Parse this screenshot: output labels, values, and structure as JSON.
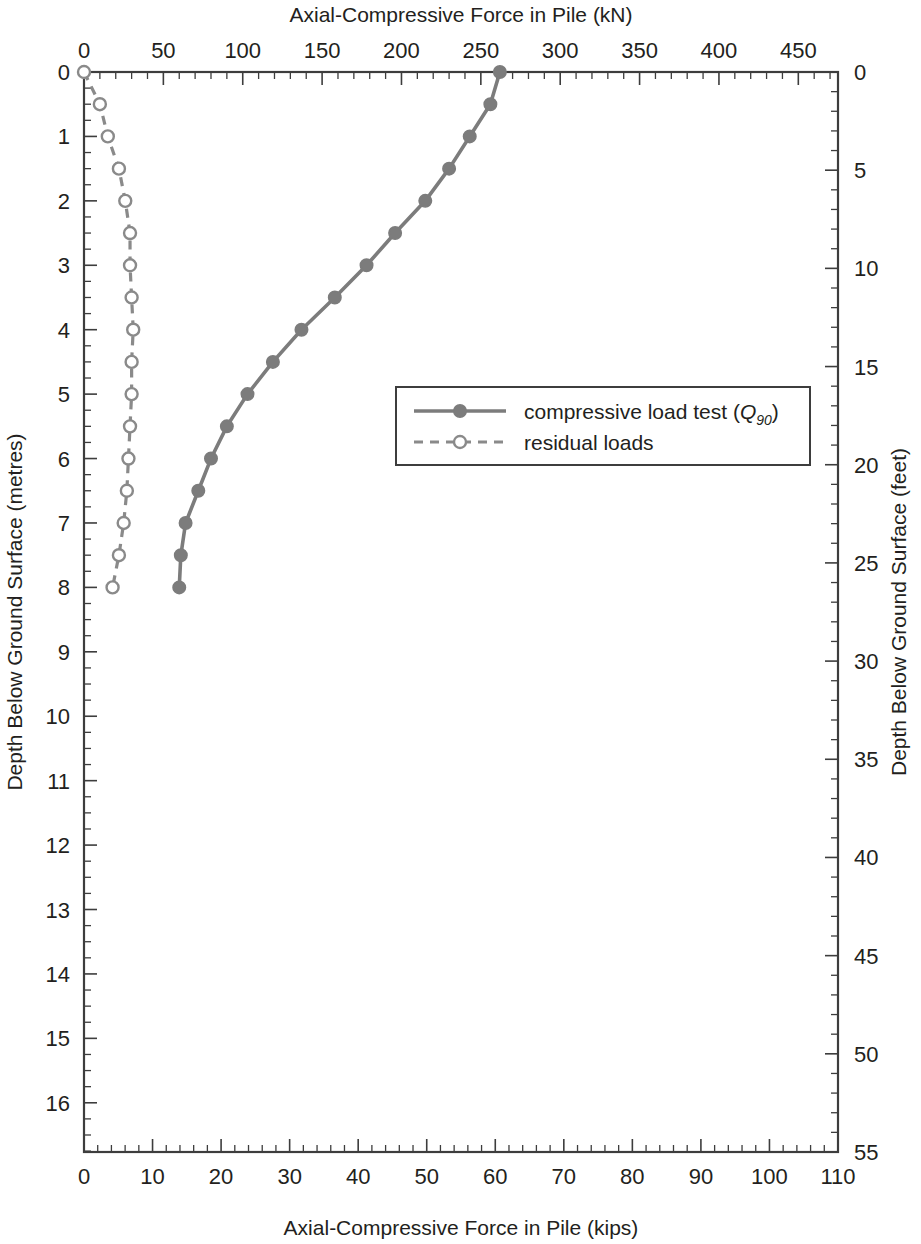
{
  "chart_data": {
    "type": "line",
    "title": "",
    "top_axis": {
      "label": "Axial-Compressive Force in Pile (kN)",
      "ticks": [
        0,
        50,
        100,
        150,
        200,
        250,
        300,
        350,
        400,
        450
      ],
      "range": [
        0,
        475
      ],
      "minor_step": 10
    },
    "bottom_axis": {
      "label": "Axial-Compressive Force in Pile (kips)",
      "ticks": [
        0,
        10,
        20,
        30,
        40,
        50,
        60,
        70,
        80,
        90,
        100,
        110
      ],
      "range": [
        0,
        110
      ],
      "minor_step": 2
    },
    "left_axis": {
      "label": "Depth Below Ground Surface (metres)",
      "ticks": [
        0,
        1,
        2,
        3,
        4,
        5,
        6,
        7,
        8,
        9,
        10,
        11,
        12,
        13,
        14,
        15,
        16
      ],
      "range": [
        0,
        16.764
      ],
      "minor_step": 0.25,
      "inverted": true
    },
    "right_axis": {
      "label": "Depth Below Ground Surface (feet)",
      "ticks": [
        0,
        5,
        10,
        15,
        20,
        25,
        30,
        35,
        40,
        45,
        50,
        55
      ],
      "range": [
        0,
        55
      ],
      "minor_step": 1,
      "inverted": true
    },
    "grid": false,
    "legend_position": "center-right",
    "series": [
      {
        "name": "compressive load test (Q90)",
        "label_main": "compressive load test (",
        "label_italic": "Q",
        "label_sub": "90",
        "label_tail": ")",
        "style": "solid",
        "marker": "filled-circle",
        "color": "#7c7c7c",
        "x_unit": "kN",
        "y_unit": "m",
        "points": [
          {
            "force_kn": 262,
            "depth_m": 0.0
          },
          {
            "force_kn": 256,
            "depth_m": 0.5
          },
          {
            "force_kn": 243,
            "depth_m": 1.0
          },
          {
            "force_kn": 230,
            "depth_m": 1.5
          },
          {
            "force_kn": 215,
            "depth_m": 2.0
          },
          {
            "force_kn": 196,
            "depth_m": 2.5
          },
          {
            "force_kn": 178,
            "depth_m": 3.0
          },
          {
            "force_kn": 158,
            "depth_m": 3.5
          },
          {
            "force_kn": 137,
            "depth_m": 4.0
          },
          {
            "force_kn": 119,
            "depth_m": 4.5
          },
          {
            "force_kn": 103,
            "depth_m": 5.0
          },
          {
            "force_kn": 90,
            "depth_m": 5.5
          },
          {
            "force_kn": 80,
            "depth_m": 6.0
          },
          {
            "force_kn": 72,
            "depth_m": 6.5
          },
          {
            "force_kn": 64,
            "depth_m": 7.0
          },
          {
            "force_kn": 61,
            "depth_m": 7.5
          },
          {
            "force_kn": 60,
            "depth_m": 8.0
          }
        ]
      },
      {
        "name": "residual loads",
        "label_main": "residual loads",
        "style": "dashed",
        "marker": "open-circle",
        "color": "#8a8a8a",
        "x_unit": "kN",
        "y_unit": "m",
        "points": [
          {
            "force_kn": 0,
            "depth_m": 0.0
          },
          {
            "force_kn": 10,
            "depth_m": 0.5
          },
          {
            "force_kn": 15,
            "depth_m": 1.0
          },
          {
            "force_kn": 22,
            "depth_m": 1.5
          },
          {
            "force_kn": 26,
            "depth_m": 2.0
          },
          {
            "force_kn": 29,
            "depth_m": 2.5
          },
          {
            "force_kn": 29,
            "depth_m": 3.0
          },
          {
            "force_kn": 30,
            "depth_m": 3.5
          },
          {
            "force_kn": 31,
            "depth_m": 4.0
          },
          {
            "force_kn": 30,
            "depth_m": 4.5
          },
          {
            "force_kn": 30,
            "depth_m": 5.0
          },
          {
            "force_kn": 29,
            "depth_m": 5.5
          },
          {
            "force_kn": 28,
            "depth_m": 6.0
          },
          {
            "force_kn": 27,
            "depth_m": 6.5
          },
          {
            "force_kn": 25,
            "depth_m": 7.0
          },
          {
            "force_kn": 22,
            "depth_m": 7.5
          },
          {
            "force_kn": 18,
            "depth_m": 8.0
          }
        ]
      }
    ]
  },
  "colors": {
    "axis": "#3d3d3d",
    "text": "#231f20",
    "series_primary": "#7c7c7c",
    "series_secondary": "#8a8a8a",
    "background": "#ffffff"
  }
}
